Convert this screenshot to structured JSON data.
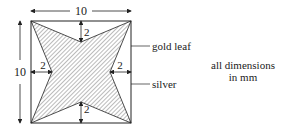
{
  "diagram": {
    "square_side_label": "10",
    "height_label": "10",
    "inset_top": "2",
    "inset_bottom": "2",
    "inset_left": "2",
    "inset_right": "2",
    "callout_gold": "gold leaf",
    "callout_silver": "silver",
    "note_line1": "all dimensions",
    "note_line2": "in mm",
    "colors": {
      "line": "#222222",
      "hatch": "#555555",
      "background": "#ffffff"
    }
  }
}
